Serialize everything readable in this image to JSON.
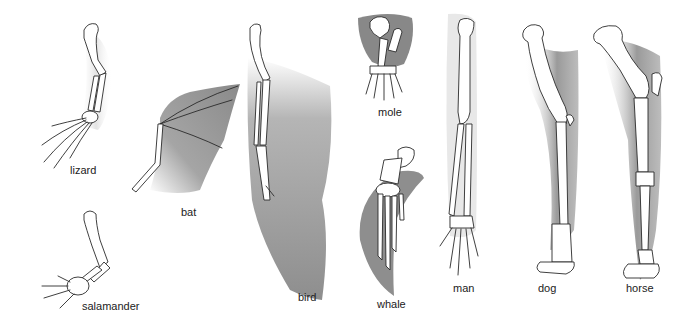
{
  "figure": {
    "shade_color": "#8c8c8c",
    "bone_fill": "#ffffff",
    "outline_color": "#2a2a2a",
    "label_color": "#222222",
    "specimens": [
      {
        "id": "lizard",
        "label": "lizard"
      },
      {
        "id": "salamander",
        "label": "salamander"
      },
      {
        "id": "bat",
        "label": "bat"
      },
      {
        "id": "bird",
        "label": "bird"
      },
      {
        "id": "mole",
        "label": "mole"
      },
      {
        "id": "whale",
        "label": "whale"
      },
      {
        "id": "man",
        "label": "man"
      },
      {
        "id": "dog",
        "label": "dog"
      },
      {
        "id": "horse",
        "label": "horse"
      }
    ]
  }
}
